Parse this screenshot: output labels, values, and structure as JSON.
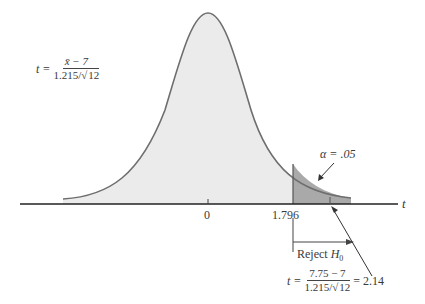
{
  "diagram": {
    "type": "t-distribution one-tailed test",
    "axis_label": "t",
    "ticks": [
      {
        "label": "0",
        "value": 0
      },
      {
        "label": "1.796",
        "value": 1.796
      }
    ],
    "alpha_label": "α = .05",
    "reject_label": "Reject",
    "reject_sub_symbol": "H",
    "reject_sub_index": "0",
    "formula_general": {
      "lhs": "t =",
      "numerator": "x̄ − 7",
      "denominator_prefix": "1.215/",
      "denominator_sqrt": "12"
    },
    "formula_computed": {
      "lhs": "t =",
      "numerator": "7.75 − 7",
      "denominator_prefix": "1.215/",
      "denominator_sqrt": "12",
      "result": "= 2.14"
    },
    "colors": {
      "curve_fill": "#ebebeb",
      "reject_fill": "#a9a9a9",
      "curve_stroke": "#6e6e6e",
      "axis": "#222222"
    }
  }
}
